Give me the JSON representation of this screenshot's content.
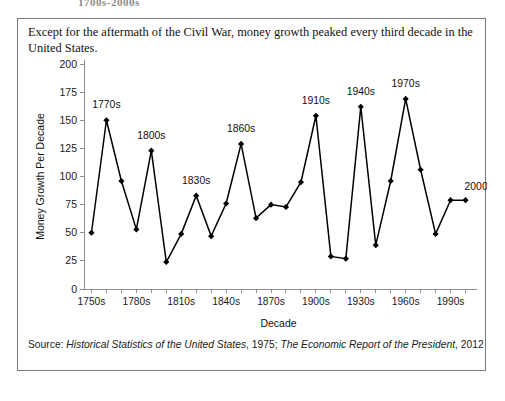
{
  "top_heading": "1700s-2000s",
  "caption": "Except for the aftermath of the Civil War, money growth peaked every third decade in the United States.",
  "source": {
    "prefix": "Source: ",
    "work1": "Historical Statistics of the United States",
    "mid": ", 1975; ",
    "work2": "The Economic Report of the President",
    "suffix": ", 2012"
  },
  "colors": {
    "line": "#000000",
    "marker": "#000000",
    "axis": "#8d8d8d",
    "text": "#111111",
    "border": "#7a7a7a",
    "background": "#ffffff"
  },
  "chart_data": {
    "type": "line",
    "title": "",
    "xlabel": "Decade",
    "ylabel": "Money Growth Per Decade",
    "ylim": [
      0,
      200
    ],
    "ytick_step": 25,
    "yticks": [
      0,
      25,
      50,
      75,
      100,
      125,
      150,
      175,
      200
    ],
    "ytick_labels": [
      "0",
      "25",
      "50",
      "75",
      "100",
      "125",
      "150",
      "175",
      "200"
    ],
    "grid": false,
    "legend": "none",
    "marker": "diamond",
    "categories": [
      "1750s",
      "1760s",
      "1770s",
      "1780s",
      "1790s",
      "1800s",
      "1810s",
      "1820s",
      "1830s",
      "1840s",
      "1850s",
      "1860s",
      "1870s",
      "1880s",
      "1890s",
      "1900s",
      "1910s",
      "1920s",
      "1930s",
      "1940s",
      "1950s",
      "1960s",
      "1970s",
      "1980s",
      "1990s",
      "2000s"
    ],
    "values": [
      50,
      150,
      96,
      53,
      123,
      24,
      49,
      83,
      47,
      76,
      129,
      63,
      75,
      73,
      95,
      154,
      29,
      27,
      162,
      39,
      96,
      169,
      106,
      49,
      79,
      79
    ],
    "xtick_labels_shown": [
      "1750s",
      "1780s",
      "1810s",
      "1840s",
      "1870s",
      "1900s",
      "1930s",
      "1960s",
      "1990s"
    ],
    "xtick_label_every": 3,
    "annotations": [
      {
        "label": "1770s",
        "index": 1,
        "value": 150
      },
      {
        "label": "1800s",
        "index": 4,
        "value": 123
      },
      {
        "label": "1830s",
        "index": 7,
        "value": 83
      },
      {
        "label": "1860s",
        "index": 10,
        "value": 129
      },
      {
        "label": "1910s",
        "index": 15,
        "value": 154
      },
      {
        "label": "1940s",
        "index": 18,
        "value": 162
      },
      {
        "label": "1970s",
        "index": 21,
        "value": 169
      },
      {
        "label": "2000s",
        "index": 24,
        "value": 79
      }
    ]
  }
}
